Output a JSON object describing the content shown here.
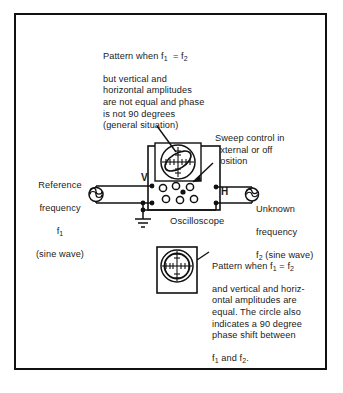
{
  "figure": {
    "title_note_top": "Pattern when f1 = f2\nbut vertical and\nhorizontal amplitudes\nare not equal and phase\nis not 90 degrees\n(general situation)",
    "top_callout": {
      "line1": "Pattern when f",
      "sub1": "1",
      "eq": " = f",
      "sub2": "2",
      "rest": "but vertical and\nhorizontal amplitudes\nare not equal and phase\nis not 90 degrees\n(general situation)"
    },
    "sweep_note": "Sweep control in\nexternal or off\nposition",
    "left_source": {
      "line1": "Reference",
      "line2": "frequency",
      "line3": "f",
      "line3_sub": "1",
      "line4": "(sine wave)"
    },
    "right_source": {
      "line1": "Unknown",
      "line2": "frequency",
      "line3": "f",
      "line3_sub": "2",
      "line3_rest": " (sine wave)"
    },
    "instrument_label": "Oscilloscope",
    "terminal_v": "V",
    "terminal_h": "H",
    "bottom_callout": {
      "line1_a": "Pattern when f",
      "line1_sub1": "1",
      "line1_b": " = f",
      "line1_sub2": "2",
      "lines": "and vertical and horiz-\nontal amplitudes are\nequal. The circle also\nindicates a 90 degree\nphase shift between",
      "last_a": "f",
      "last_sub1": "1",
      "last_b": " and f",
      "last_sub2": "2",
      "last_c": "."
    }
  },
  "colors": {
    "ink": "#111111",
    "paper": "#ffffff"
  },
  "icons": {
    "scope_screen": "lissajous-ellipse-pattern",
    "scope_screen_bottom": "circle-pattern",
    "generator_left": "sine-generator-symbol",
    "generator_right": "sine-generator-symbol",
    "ground": "earth-ground-symbol"
  }
}
